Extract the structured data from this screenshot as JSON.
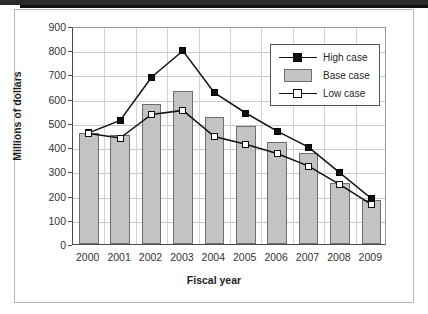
{
  "figure": {
    "background": "#ffffff",
    "frame_color": "#b9b9b9"
  },
  "chart_data": {
    "type": "bar",
    "title": "",
    "subtitle": "",
    "xlabel": "Fiscal year",
    "ylabel": "Millions of dollars",
    "categories": [
      "2000",
      "2001",
      "2002",
      "2003",
      "2004",
      "2005",
      "2006",
      "2007",
      "2008",
      "2009"
    ],
    "ylim": [
      0,
      900
    ],
    "ytick_values": [
      0,
      100,
      200,
      300,
      400,
      500,
      600,
      700,
      800,
      900
    ],
    "ytick_labels": [
      "0",
      "100",
      "200",
      "300",
      "400",
      "500",
      "600",
      "700",
      "800",
      "900"
    ],
    "grid": true,
    "grid_axis": "y",
    "legend_position": "upper right",
    "series": [
      {
        "name": "High case",
        "type": "line",
        "marker": "filled-square",
        "color": "#111111",
        "values": [
          467,
          518,
          697,
          806,
          633,
          549,
          474,
          408,
          302,
          196
        ]
      },
      {
        "name": "Base case",
        "type": "bar",
        "color": "#c3c3c3",
        "edge_color": "#6f6f6f",
        "values": [
          459,
          449,
          580,
          630,
          525,
          487,
          423,
          375,
          252,
          182
        ]
      },
      {
        "name": "Low case",
        "type": "line",
        "marker": "open-square",
        "color": "#111111",
        "fill": "#ffffff",
        "values": [
          465,
          446,
          543,
          560,
          452,
          420,
          382,
          330,
          253,
          172
        ]
      }
    ]
  },
  "legend": {
    "entries": [
      {
        "label": "High case",
        "glyph": "line-filled-square-icon"
      },
      {
        "label": "Base case",
        "glyph": "bar-swatch-icon"
      },
      {
        "label": "Low case",
        "glyph": "line-open-square-icon"
      }
    ]
  }
}
